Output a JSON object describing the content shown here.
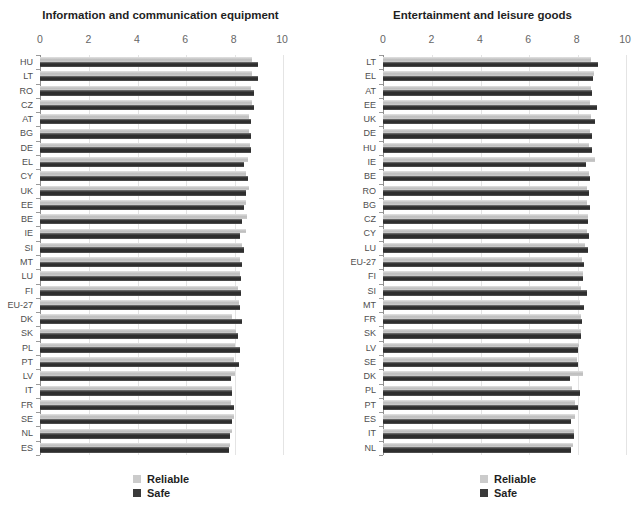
{
  "legend": {
    "reliable_label": "Reliable",
    "safe_label": "Safe"
  },
  "colors": {
    "background": "#ffffff",
    "reliable_bar": "#c5c5c5",
    "safe_bar": "#3a3a3a",
    "axis_line": "#8f8f8f",
    "gridline": "#e4e4e4",
    "category_label": "#4f4f4f",
    "tick_label": "#666666",
    "title_text": "#1f1f1f"
  },
  "chart_data": [
    {
      "type": "bar",
      "orientation": "horizontal",
      "title": "Information and communication equipment",
      "xlabel": "",
      "ylabel": "",
      "xlim": [
        0,
        10
      ],
      "xticks": [
        0,
        2,
        4,
        6,
        8,
        10
      ],
      "grid": "faint vertical gridlines at each x tick",
      "legend_position": "below plot, stacked",
      "categories": [
        "HU",
        "LT",
        "RO",
        "CZ",
        "AT",
        "BG",
        "DE",
        "EL",
        "CY",
        "UK",
        "EE",
        "BE",
        "IE",
        "SI",
        "MT",
        "LU",
        "FI",
        "EU-27",
        "DK",
        "SK",
        "PL",
        "PT",
        "LV",
        "IT",
        "FR",
        "SE",
        "NL",
        "ES"
      ],
      "series": [
        {
          "name": "Reliable",
          "values": [
            8.75,
            8.78,
            8.7,
            8.77,
            8.65,
            8.65,
            8.68,
            8.6,
            8.52,
            8.65,
            8.5,
            8.55,
            8.5,
            8.35,
            8.25,
            8.25,
            8.2,
            8.22,
            7.95,
            8.1,
            8.05,
            8.0,
            8.05,
            7.95,
            7.9,
            8.0,
            7.95,
            7.85
          ]
        },
        {
          "name": "Safe",
          "values": [
            9.0,
            9.0,
            8.85,
            8.85,
            8.73,
            8.7,
            8.7,
            8.45,
            8.58,
            8.52,
            8.45,
            8.35,
            8.25,
            8.42,
            8.33,
            8.3,
            8.3,
            8.27,
            8.35,
            8.2,
            8.25,
            8.22,
            7.88,
            7.95,
            8.0,
            7.95,
            7.85,
            7.8
          ]
        }
      ]
    },
    {
      "type": "bar",
      "orientation": "horizontal",
      "title": "Entertainment and leisure goods",
      "xlabel": "",
      "ylabel": "",
      "xlim": [
        0,
        10
      ],
      "xticks": [
        0,
        2,
        4,
        6,
        8,
        10
      ],
      "grid": "faint vertical gridlines at each x tick",
      "legend_position": "below plot, stacked",
      "categories": [
        "LT",
        "EL",
        "AT",
        "EE",
        "UK",
        "DE",
        "HU",
        "IE",
        "BE",
        "RO",
        "BG",
        "CZ",
        "CY",
        "LU",
        "EU-27",
        "FI",
        "SI",
        "MT",
        "FR",
        "SK",
        "LV",
        "SE",
        "DK",
        "PL",
        "PT",
        "ES",
        "IT",
        "NL"
      ],
      "series": [
        {
          "name": "Reliable",
          "values": [
            8.6,
            8.72,
            8.6,
            8.55,
            8.6,
            8.55,
            8.5,
            8.75,
            8.5,
            8.45,
            8.45,
            8.48,
            8.45,
            8.35,
            8.23,
            8.27,
            8.2,
            8.16,
            8.19,
            8.19,
            8.09,
            8.0,
            8.27,
            7.82,
            7.95,
            7.95,
            7.88,
            7.86
          ]
        },
        {
          "name": "Safe",
          "values": [
            8.9,
            8.68,
            8.65,
            8.85,
            8.75,
            8.65,
            8.65,
            8.4,
            8.55,
            8.5,
            8.55,
            8.48,
            8.5,
            8.48,
            8.3,
            8.26,
            8.44,
            8.3,
            8.23,
            8.2,
            8.05,
            8.05,
            7.72,
            8.15,
            8.05,
            7.77,
            7.88,
            7.75
          ]
        }
      ]
    }
  ]
}
